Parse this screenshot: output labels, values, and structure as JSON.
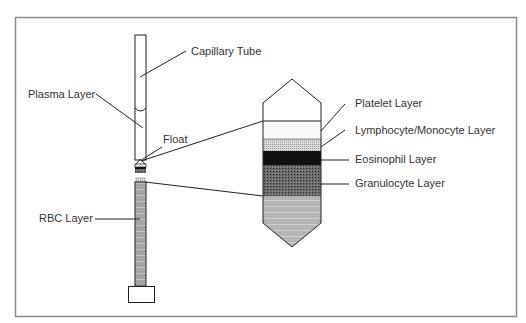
{
  "diagram": {
    "title": "",
    "labels": {
      "capillary_tube": "Capillary Tube",
      "plasma_layer": "Plasma Layer",
      "float": "Float",
      "rbc_layer": "RBC Layer",
      "platelet_layer": "Platelet Layer",
      "lymphocyte_monocyte_layer": "Lymphocyte/Monocyte Layer",
      "eosinophil_layer": "Eosinophil Layer",
      "granulocyte_layer": "Granulocyte Layer"
    },
    "colors": {
      "line": "#222222",
      "frame": "#888888",
      "rbc": "#a8a8a8",
      "eosinophil": "#111111",
      "granulocyte": "#555555",
      "lymphocyte": "#cccccc",
      "bottom": "#b8b8b8"
    }
  }
}
